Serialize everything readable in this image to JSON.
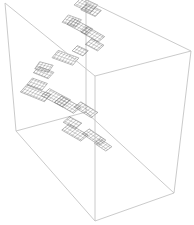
{
  "figure": {
    "type": "3d-bounding-box-with-fractal-mesh",
    "width": 194,
    "height": 225,
    "box_color": "#c4c4c4",
    "mesh_color": "#555555",
    "background": "#ffffff",
    "box_vertices": {
      "back_top_left": [
        5,
        3
      ],
      "back_top_right": [
        86,
        0
      ],
      "right_top": [
        191,
        51
      ],
      "front_top": [
        95,
        76
      ],
      "left_bottom": [
        16,
        131
      ],
      "back_bottom": [
        86,
        112
      ],
      "right_bottom": [
        174,
        193
      ],
      "front_bottom": [
        95,
        221
      ]
    },
    "visible_edges": [
      [
        "back_top_left",
        "front_top"
      ],
      [
        "front_top",
        "right_top"
      ],
      [
        "right_top",
        "back_top_right"
      ],
      [
        "back_top_left",
        "left_bottom"
      ],
      [
        "front_top",
        "front_bottom"
      ],
      [
        "right_top",
        "right_bottom"
      ],
      [
        "left_bottom",
        "front_bottom"
      ],
      [
        "front_bottom",
        "right_bottom"
      ]
    ],
    "hidden_edges": [
      [
        "back_top_right",
        "back_bottom"
      ],
      [
        "back_bottom",
        "left_bottom"
      ],
      [
        "back_bottom",
        "right_bottom"
      ]
    ],
    "mesh_patches": [
      {
        "c": [
          88,
          6
        ],
        "w": 18,
        "h": 10,
        "a": 25
      },
      {
        "c": [
          95,
          12
        ],
        "w": 16,
        "h": 8,
        "a": 25
      },
      {
        "c": [
          80,
          24
        ],
        "w": 14,
        "h": 9,
        "a": 20
      },
      {
        "c": [
          90,
          32
        ],
        "w": 22,
        "h": 8,
        "a": 28
      },
      {
        "c": [
          106,
          42
        ],
        "w": 20,
        "h": 8,
        "a": 30
      },
      {
        "c": [
          112,
          54
        ],
        "w": 14,
        "h": 8,
        "a": 28
      },
      {
        "c": [
          100,
          60
        ],
        "w": 12,
        "h": 7,
        "a": 25
      },
      {
        "c": [
          88,
          66
        ],
        "w": 22,
        "h": 9,
        "a": 20
      },
      {
        "c": [
          70,
          74
        ],
        "w": 14,
        "h": 8,
        "a": 15
      },
      {
        "c": [
          72,
          84
        ],
        "w": 16,
        "h": 8,
        "a": 22
      },
      {
        "c": [
          70,
          96
        ],
        "w": 16,
        "h": 8,
        "a": 20
      },
      {
        "c": [
          72,
          108
        ],
        "w": 26,
        "h": 9,
        "a": 22
      },
      {
        "c": [
          94,
          118
        ],
        "w": 24,
        "h": 10,
        "a": 28
      },
      {
        "c": [
          108,
          128
        ],
        "w": 22,
        "h": 9,
        "a": 30
      },
      {
        "c": [
          128,
          136
        ],
        "w": 20,
        "h": 8,
        "a": 32
      },
      {
        "c": [
          120,
          148
        ],
        "w": 14,
        "h": 8,
        "a": 28
      },
      {
        "c": [
          126,
          162
        ],
        "w": 22,
        "h": 9,
        "a": 30
      },
      {
        "c": [
          146,
          172
        ],
        "w": 20,
        "h": 8,
        "a": 34
      },
      {
        "c": [
          158,
          182
        ],
        "w": 14,
        "h": 7,
        "a": 34
      }
    ]
  }
}
